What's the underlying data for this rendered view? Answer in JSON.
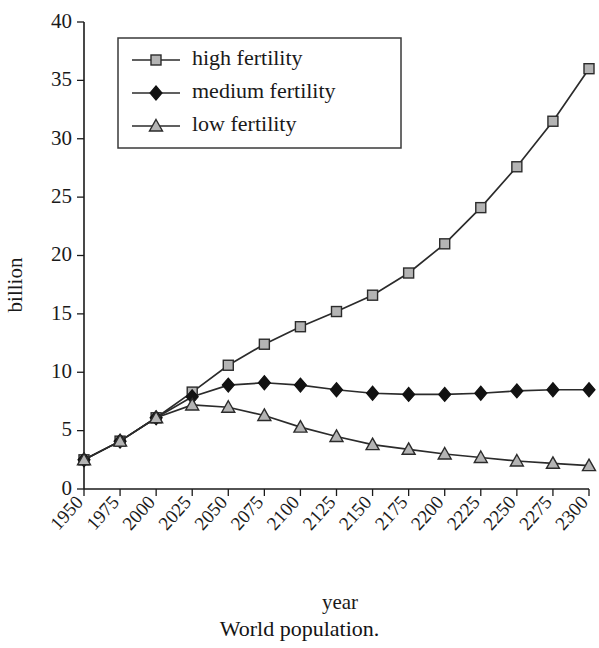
{
  "caption": "World population.",
  "chart_data": {
    "type": "line",
    "title": "World population.",
    "xlabel": "year",
    "ylabel": "billion",
    "grid": false,
    "legend_position": "top-left-inside",
    "xlim": [
      1950,
      2300
    ],
    "ylim": [
      0,
      40
    ],
    "ytick_values": [
      0,
      5,
      10,
      15,
      20,
      25,
      30,
      35,
      40
    ],
    "ytick_labels": [
      "0",
      "5",
      "10",
      "15",
      "20",
      "25",
      "30",
      "35",
      "40"
    ],
    "categories": [
      1950,
      1975,
      2000,
      2025,
      2050,
      2075,
      2100,
      2125,
      2150,
      2175,
      2200,
      2225,
      2250,
      2275,
      2300
    ],
    "xtick_labels": [
      "1950",
      "1975",
      "2000",
      "2025",
      "2050",
      "2075",
      "2100",
      "2125",
      "2150",
      "2175",
      "2200",
      "2225",
      "2250",
      "2275",
      "2300"
    ],
    "series": [
      {
        "name": "high fertility",
        "marker": "square",
        "marker_fill": "#b4b4b4",
        "line_color": "#2b2b2b",
        "values": [
          2.5,
          4.1,
          6.1,
          8.3,
          10.6,
          12.4,
          13.9,
          15.2,
          16.6,
          18.5,
          21.0,
          24.1,
          27.6,
          31.5,
          36.0
        ]
      },
      {
        "name": "medium fertility",
        "marker": "diamond",
        "marker_fill": "#121212",
        "line_color": "#2b2b2b",
        "values": [
          2.5,
          4.1,
          6.1,
          7.9,
          8.9,
          9.1,
          8.9,
          8.5,
          8.2,
          8.1,
          8.1,
          8.2,
          8.4,
          8.5,
          8.5
        ]
      },
      {
        "name": "low fertility",
        "marker": "triangle",
        "marker_fill": "#b4b4b4",
        "line_color": "#2b2b2b",
        "values": [
          2.5,
          4.1,
          6.1,
          7.2,
          7.0,
          6.3,
          5.3,
          4.5,
          3.8,
          3.4,
          3.0,
          2.7,
          2.4,
          2.2,
          2.0
        ]
      }
    ]
  },
  "legend": {
    "items": [
      {
        "label": "high fertility",
        "marker": "square"
      },
      {
        "label": "medium fertility",
        "marker": "diamond"
      },
      {
        "label": "low fertility",
        "marker": "triangle"
      }
    ]
  }
}
